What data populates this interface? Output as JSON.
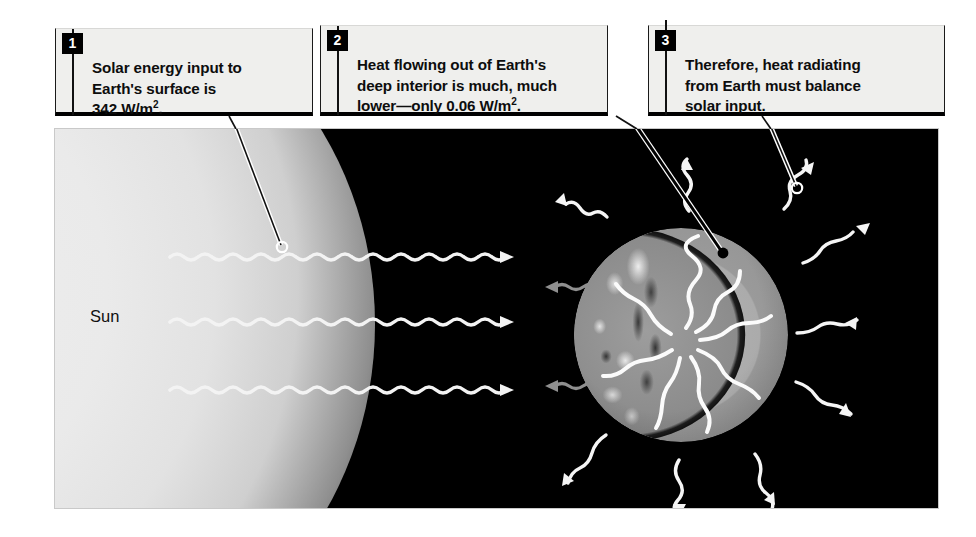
{
  "figure": {
    "callouts": [
      {
        "number": "1",
        "text": "Solar energy input to\nEarth's surface is\n342 W/m",
        "superscript": "2",
        "text_after": "."
      },
      {
        "number": "2",
        "text": "Heat flowing out of Earth's\ndeep interior is much, much\nlower—only 0.06 W/m",
        "superscript": "2",
        "text_after": "."
      },
      {
        "number": "3",
        "text": "Therefore, heat radiating\nfrom Earth must balance\nsolar input.",
        "superscript": "",
        "text_after": ""
      }
    ],
    "labels": {
      "sun": "Sun"
    },
    "colors": {
      "space_background": "#000000",
      "callout_fill": "#efefed",
      "badge_fill": "#000000",
      "badge_text": "#ffffff",
      "ray_incoming": "#f2f2f2",
      "ray_outgoing_dim": "#8a8a8a",
      "page_background": "#ffffff"
    }
  }
}
